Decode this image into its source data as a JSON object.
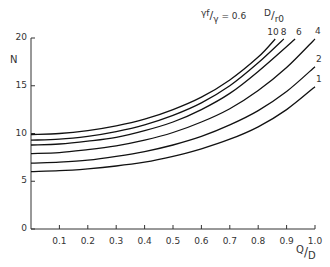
{
  "chart_data": {
    "type": "line",
    "title": "",
    "annotation": "γf/γ = 0.6",
    "legend_title": "D/r0",
    "xlabel": "Q/D",
    "ylabel": "N",
    "xlim": [
      0,
      1.0
    ],
    "ylim": [
      0,
      20
    ],
    "grid": false,
    "x_ticks": [
      "0.1",
      "0.2",
      "0.3",
      "0.4",
      "0.5",
      "0.6",
      "0.7",
      "0.8",
      "0.9",
      "1.0"
    ],
    "y_ticks": [
      "0",
      "5",
      "10",
      "15",
      "20"
    ],
    "series": [
      {
        "name": "10",
        "x": [
          0,
          0.1,
          0.2,
          0.3,
          0.4,
          0.5,
          0.6,
          0.7,
          0.8,
          0.86
        ],
        "y": [
          9.9,
          10.0,
          10.3,
          10.8,
          11.5,
          12.5,
          13.8,
          15.6,
          18.0,
          19.9
        ]
      },
      {
        "name": "8",
        "x": [
          0,
          0.1,
          0.2,
          0.3,
          0.4,
          0.5,
          0.6,
          0.7,
          0.8,
          0.89
        ],
        "y": [
          9.3,
          9.4,
          9.7,
          10.2,
          10.9,
          11.9,
          13.2,
          15.0,
          17.4,
          19.9
        ]
      },
      {
        "name": "6",
        "x": [
          0,
          0.1,
          0.2,
          0.3,
          0.4,
          0.5,
          0.6,
          0.7,
          0.8,
          0.93
        ],
        "y": [
          8.8,
          8.9,
          9.2,
          9.6,
          10.3,
          11.2,
          12.5,
          14.2,
          16.5,
          19.9
        ]
      },
      {
        "name": "4",
        "x": [
          0,
          0.1,
          0.2,
          0.3,
          0.4,
          0.5,
          0.6,
          0.7,
          0.8,
          0.9,
          1.0
        ],
        "y": [
          7.9,
          8.0,
          8.3,
          8.7,
          9.3,
          10.1,
          11.2,
          12.6,
          14.5,
          16.9,
          19.9
        ]
      },
      {
        "name": "2",
        "x": [
          0,
          0.1,
          0.2,
          0.3,
          0.4,
          0.5,
          0.6,
          0.7,
          0.8,
          0.9,
          1.0
        ],
        "y": [
          6.9,
          7.0,
          7.2,
          7.6,
          8.1,
          8.8,
          9.7,
          10.9,
          12.4,
          14.4,
          17.0
        ]
      },
      {
        "name": "1",
        "x": [
          0,
          0.1,
          0.2,
          0.3,
          0.4,
          0.5,
          0.6,
          0.7,
          0.8,
          0.9,
          1.0
        ],
        "y": [
          6.0,
          6.1,
          6.3,
          6.6,
          7.0,
          7.6,
          8.4,
          9.4,
          10.7,
          12.5,
          14.9
        ]
      }
    ]
  },
  "labels": {
    "y_axis": "N",
    "x_axis_num": "Q",
    "x_axis_den": "D",
    "annotation_num": "γf",
    "annotation_den": "γ",
    "annotation_value": "= 0.6",
    "legend_num": "D",
    "legend_den": "r0"
  }
}
